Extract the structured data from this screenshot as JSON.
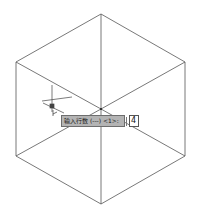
{
  "drawing": {
    "shape": "isometric-cube-wireframe",
    "line_color": "#555555",
    "vertices": {
      "top": [
        101,
        14
      ],
      "upper_left": [
        16,
        62
      ],
      "upper_right": [
        185,
        62
      ],
      "lower_left": [
        16,
        156
      ],
      "lower_right": [
        185,
        156
      ],
      "bottom": [
        101,
        204
      ],
      "center": [
        101,
        109
      ]
    }
  },
  "cursor": {
    "icon": "crosshair-cursor-icon",
    "position": [
      52,
      107
    ]
  },
  "dynamic_input": {
    "prompt": "输入行数 (---) <1>:",
    "value": "4"
  }
}
